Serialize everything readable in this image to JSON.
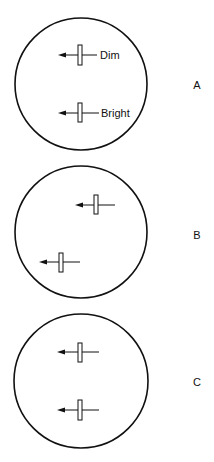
{
  "panels": [
    {
      "label": "A",
      "circle": {
        "cx": 81,
        "cy": 84,
        "r": 66
      },
      "markers": [
        {
          "rect": {
            "x": 78,
            "y": 45,
            "w": 4,
            "h": 20
          },
          "line": {
            "y": 55,
            "x1": 58,
            "x2": 97
          },
          "text": "Dim",
          "text_x": 100
        },
        {
          "rect": {
            "x": 78,
            "y": 103,
            "w": 4,
            "h": 19
          },
          "line": {
            "y": 113,
            "x1": 58,
            "x2": 99
          },
          "text": "Bright",
          "text_x": 101
        }
      ]
    },
    {
      "label": "B",
      "circle": {
        "cx": 81,
        "cy": 232,
        "r": 66
      },
      "markers": [
        {
          "rect": {
            "x": 94,
            "y": 195,
            "w": 4,
            "h": 19
          },
          "line": {
            "y": 205,
            "x1": 75,
            "x2": 115
          },
          "text": ""
        },
        {
          "rect": {
            "x": 59,
            "y": 253,
            "w": 4,
            "h": 19
          },
          "line": {
            "y": 262,
            "x1": 39,
            "x2": 80
          },
          "text": ""
        }
      ]
    },
    {
      "label": "C",
      "circle": {
        "cx": 81,
        "cy": 381,
        "r": 67
      },
      "markers": [
        {
          "rect": {
            "x": 78,
            "y": 343,
            "w": 4,
            "h": 19
          },
          "line": {
            "y": 352,
            "x1": 57,
            "x2": 99
          },
          "text": ""
        },
        {
          "rect": {
            "x": 78,
            "y": 400,
            "w": 4,
            "h": 20
          },
          "line": {
            "y": 410,
            "x1": 57,
            "x2": 99
          },
          "text": ""
        }
      ]
    }
  ],
  "label_x": 197,
  "label_y": [
    89,
    239,
    386
  ],
  "colors": {
    "stroke": "#111111",
    "background": "#ffffff"
  }
}
